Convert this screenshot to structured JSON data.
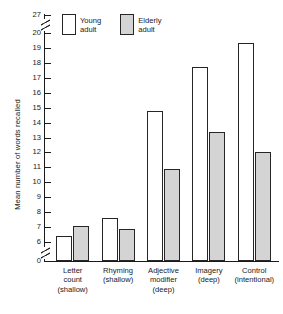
{
  "chart_data": {
    "type": "bar",
    "title": "",
    "xlabel": "",
    "ylabel": "Mean number of words recalled",
    "categories": [
      "Letter count (shallow)",
      "Rhyming (shallow)",
      "Adjective modifier (deep)",
      "Imagery (deep)",
      "Control (intentional)"
    ],
    "category_lines": [
      [
        "Letter",
        "count",
        "(shallow)"
      ],
      [
        "Rhyming",
        "(shallow)"
      ],
      [
        "Adjective",
        "modifier",
        "(deep)"
      ],
      [
        "Imagery",
        "(deep)"
      ],
      [
        "Control",
        "(intentional)"
      ]
    ],
    "series": [
      {
        "name": "Young adult",
        "name_lines": [
          "Young",
          "adult"
        ],
        "color": "#ffffff",
        "values": [
          6.4,
          7.6,
          14.8,
          17.7,
          19.3
        ]
      },
      {
        "name": "Elderly adult",
        "name_lines": [
          "Elderly",
          "adult"
        ],
        "color": "#d4d4d4",
        "values": [
          7.1,
          6.9,
          10.9,
          13.4,
          12.0
        ]
      }
    ],
    "ytick_labels": [
      "27",
      "20",
      "19",
      "18",
      "17",
      "16",
      "15",
      "14",
      "13",
      "12",
      "11",
      "10",
      "9",
      "8",
      "7",
      "6",
      "0"
    ],
    "ylim": [
      0,
      27
    ],
    "axis_breaks": [
      "between 6 and 0",
      "between 20 and 27"
    ],
    "grid": false,
    "legend_position": "top-left inside"
  },
  "legend": {
    "young": {
      "line1": "Young",
      "line2": "adult"
    },
    "elderly": {
      "line1": "Elderly",
      "line2": "adult"
    }
  },
  "axis": {
    "y_title": "Mean number of words recalled"
  }
}
